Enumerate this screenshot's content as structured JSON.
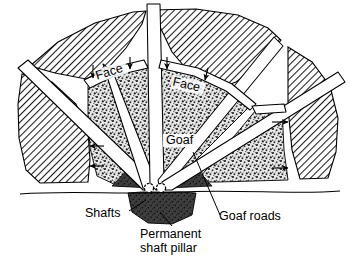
{
  "figure": {
    "type": "mining-plan-diagram",
    "background_color": "#ffffff",
    "ink_color": "#000000"
  },
  "labels": {
    "face_left": "Face",
    "face_right": "Face",
    "goaf": "Goaf",
    "shafts": "Shafts",
    "goaf_roads": "Goaf roads",
    "permanent_pillar_line1": "Permanent",
    "permanent_pillar_line2": "shaft pillar"
  },
  "legend_semantics": {
    "hatched_region": "Solid unworked coal",
    "stippled_region": "Goaf (worked-out waste)",
    "dark_region": "Permanent shaft pillar",
    "white_strips": "Goaf roads / roadways",
    "small_circles": "Shafts"
  },
  "colors": {
    "hatch_line": "#1a1a1a",
    "stipple_dark": "#2e2e2e",
    "stipple_light": "#b8b8b8",
    "pillar_fill": "#3d3d3d",
    "road_fill": "#ffffff",
    "outline": "#000000"
  },
  "counts": {
    "shaft_circles": 2,
    "face_labels": 2,
    "face_arrows": 4,
    "side_arrows": 4,
    "radial_roads": 5
  }
}
